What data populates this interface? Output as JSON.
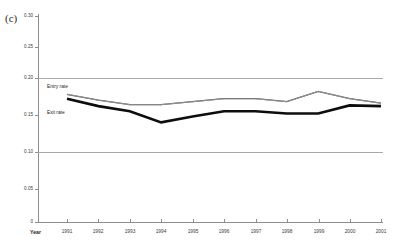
{
  "figure": {
    "panel_label": "(c)"
  },
  "axes": {
    "x_title": "Year",
    "y_ticks": [
      "0.30",
      "0.25",
      "0.20",
      "0.15",
      "0.10",
      "0.05",
      "0"
    ],
    "x_ticks": [
      "1991",
      "1992",
      "1993",
      "1994",
      "1995",
      "1996",
      "1997",
      "1998",
      "1999",
      "2000",
      "2001"
    ]
  },
  "labels": {
    "entry": "Entry rate",
    "exit": "Exit rate"
  },
  "colors": {
    "entry_line": "#1a1a1a",
    "exit_line": "#0d0d0d",
    "gridline": "#a9a9a9",
    "axis": "#8d8d8d",
    "text": "#1d1d1d",
    "background": "#ffffff"
  },
  "chart_data": {
    "type": "line",
    "title": "",
    "xlabel": "Year",
    "ylabel": "",
    "x": [
      1991,
      1992,
      1993,
      1994,
      1995,
      1996,
      1997,
      1998,
      1999,
      2000,
      2001
    ],
    "categories": [
      "1991",
      "1992",
      "1993",
      "1994",
      "1995",
      "1996",
      "1997",
      "1998",
      "1999",
      "2000",
      "2001"
    ],
    "series": [
      {
        "name": "Entry rate",
        "values": [
          0.178,
          0.17,
          0.164,
          0.164,
          0.168,
          0.172,
          0.172,
          0.168,
          0.182,
          0.172,
          0.166
        ]
      },
      {
        "name": "Exit rate",
        "values": [
          0.172,
          0.162,
          0.155,
          0.14,
          0.148,
          0.155,
          0.155,
          0.152,
          0.152,
          0.163,
          0.162
        ]
      }
    ],
    "ylim": [
      0,
      0.3
    ],
    "ytick_values": [
      0.3,
      0.25,
      0.2,
      0.15,
      0.1,
      0.05,
      0
    ],
    "gridlines_at": [
      0.2,
      0.1
    ],
    "grid": true,
    "legend_position": "inline-left"
  }
}
